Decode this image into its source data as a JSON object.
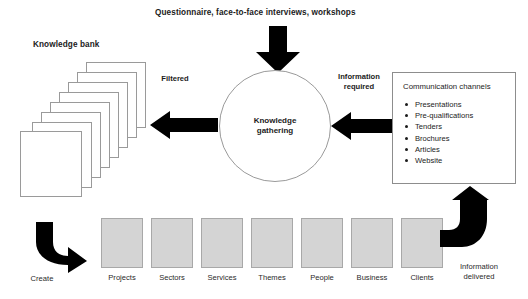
{
  "diagram": {
    "top_heading": "Questionnaire, face-to-face interviews, workshops",
    "knowledge_bank_title": "Knowledge bank",
    "filtered_label": "Filtered",
    "information_required_label_line1": "Information",
    "information_required_label_line2": "required",
    "center_label_line1": "Knowledge",
    "center_label_line2": "gathering",
    "create_label": "Create",
    "information_delivered_line1": "Information",
    "information_delivered_line2": "delivered",
    "communication_channels": {
      "title": "Communication channels",
      "items": [
        "Presentations",
        "Pre-qualifications",
        "Tenders",
        "Brochures",
        "Articles",
        "Website"
      ]
    },
    "categories": [
      "Projects",
      "Sectors",
      "Services",
      "Themes",
      "People",
      "Business",
      "Clients"
    ],
    "colors": {
      "arrow_fill": "#000000",
      "box_fill": "#d4d4d4",
      "box_border": "#a8a8a8",
      "outline": "#9a9a9a",
      "text": "#1b1b1b",
      "background": "#ffffff"
    }
  }
}
